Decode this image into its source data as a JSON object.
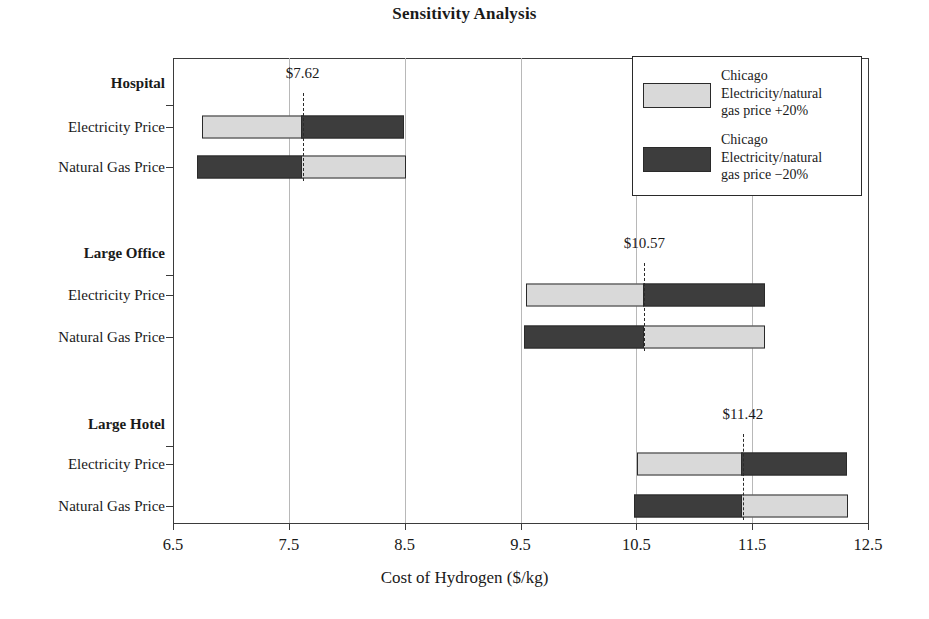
{
  "chart_data": {
    "type": "bar",
    "subtype": "tornado-sensitivity",
    "title": "Sensitivity Analysis",
    "xlabel": "Cost of Hydrogen ($/kg)",
    "ylabel": "",
    "xlim": [
      6.5,
      12.5
    ],
    "xticks": [
      "6.5",
      "7.5",
      "8.5",
      "9.5",
      "10.5",
      "11.5",
      "12.5"
    ],
    "xtick_values": [
      6.5,
      7.5,
      8.5,
      9.5,
      10.5,
      11.5,
      12.5
    ],
    "grid": "vertical",
    "legend_position": "top-right",
    "legend": [
      {
        "key": "plus20",
        "label": "Chicago\nElectricity/natural\ngas price  +20%",
        "color": "#d9d9d9"
      },
      {
        "key": "minus20",
        "label": "Chicago\nElectricity/natural\ngas price −20%",
        "color": "#3d3d3d"
      }
    ],
    "groups": [
      {
        "name": "Hospital",
        "baseline": 7.62,
        "baseline_label": "$7.62",
        "rows": [
          {
            "label": "Electricity Price",
            "low": 6.75,
            "high": 8.49,
            "low_series": "plus20",
            "high_series": "minus20"
          },
          {
            "label": "Natural Gas Price",
            "low": 6.71,
            "high": 8.51,
            "low_series": "minus20",
            "high_series": "plus20"
          }
        ]
      },
      {
        "name": "Large Office",
        "baseline": 10.57,
        "baseline_label": "$10.57",
        "rows": [
          {
            "label": "Electricity Price",
            "low": 9.55,
            "high": 11.61,
            "low_series": "plus20",
            "high_series": "minus20"
          },
          {
            "label": "Natural Gas Price",
            "low": 9.53,
            "high": 11.61,
            "low_series": "minus20",
            "high_series": "plus20"
          }
        ]
      },
      {
        "name": "Large Hotel",
        "baseline": 11.42,
        "baseline_label": "$11.42",
        "rows": [
          {
            "label": "Electricity Price",
            "low": 10.51,
            "high": 12.32,
            "low_series": "plus20",
            "high_series": "minus20"
          },
          {
            "label": "Natural Gas Price",
            "low": 10.48,
            "high": 12.33,
            "low_series": "minus20",
            "high_series": "plus20"
          }
        ]
      }
    ]
  },
  "colors": {
    "light": "#d9d9d9",
    "dark": "#3d3d3d",
    "axis": "#3b3b3b",
    "grid": "#b8b8b8",
    "text": "#1a1a1a"
  }
}
